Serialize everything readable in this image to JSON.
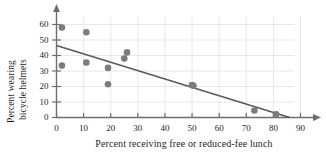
{
  "chart_data": {
    "type": "scatter",
    "title": "",
    "subtitle": "",
    "xlabel": "Percent receiving free or reduced-fee lunch",
    "ylabel": "Percent wearing bicycle helmets",
    "ylabel_lines": [
      "Percent wearing",
      "bicycle helmets"
    ],
    "xlim": [
      0,
      90
    ],
    "ylim": [
      0,
      60
    ],
    "xticks": [
      0,
      10,
      20,
      30,
      40,
      50,
      60,
      70,
      80,
      90
    ],
    "yticks": [
      0,
      10,
      20,
      30,
      40,
      50,
      60
    ],
    "xtick_labels": [
      "0",
      "10",
      "20",
      "30",
      "40",
      "50",
      "60",
      "70",
      "80",
      "90"
    ],
    "ytick_labels": [
      "0",
      "10",
      "20",
      "30",
      "40",
      "50",
      "60"
    ],
    "grid": true,
    "legend": null,
    "axis_arrows": [
      "x-right",
      "y-top"
    ],
    "points": [
      {
        "x": 2,
        "y": 58
      },
      {
        "x": 2,
        "y": 33.5
      },
      {
        "x": 11,
        "y": 55
      },
      {
        "x": 11,
        "y": 35.5
      },
      {
        "x": 19,
        "y": 32
      },
      {
        "x": 19,
        "y": 21.5
      },
      {
        "x": 25,
        "y": 38
      },
      {
        "x": 26,
        "y": 42
      },
      {
        "x": 50,
        "y": 21
      },
      {
        "x": 50.5,
        "y": 20.5
      },
      {
        "x": 73,
        "y": 4.5
      },
      {
        "x": 81,
        "y": 2
      }
    ],
    "trend_line": {
      "type": "line",
      "x_start": 0,
      "y_start": 46.5,
      "x_end": 86,
      "y_end": 0
    },
    "colors": {
      "point": "#7c7c80",
      "trend_line": "#58595b",
      "axis": "#6d6e71",
      "grid": "#e6e7e8",
      "text": "#231f20",
      "background": "#ffffff"
    },
    "marker": {
      "shape": "circle",
      "size": 4.6
    }
  }
}
